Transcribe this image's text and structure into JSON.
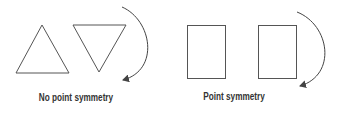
{
  "panels": [
    {
      "caption": "No point symmetry",
      "shape": "triangle",
      "rotated_shape": "inverted-triangle"
    },
    {
      "caption": "Point symmetry",
      "shape": "rectangle",
      "rotated_shape": "rectangle"
    }
  ],
  "colors": {
    "stroke": "#555555",
    "text": "#333333",
    "background": "#ffffff"
  }
}
